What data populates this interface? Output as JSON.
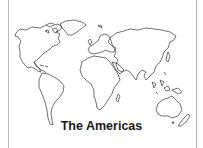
{
  "figure": {
    "caption": "The Americas",
    "line_color": "#333333",
    "background": "#ffffff",
    "border_color": "#b8b8b8"
  }
}
